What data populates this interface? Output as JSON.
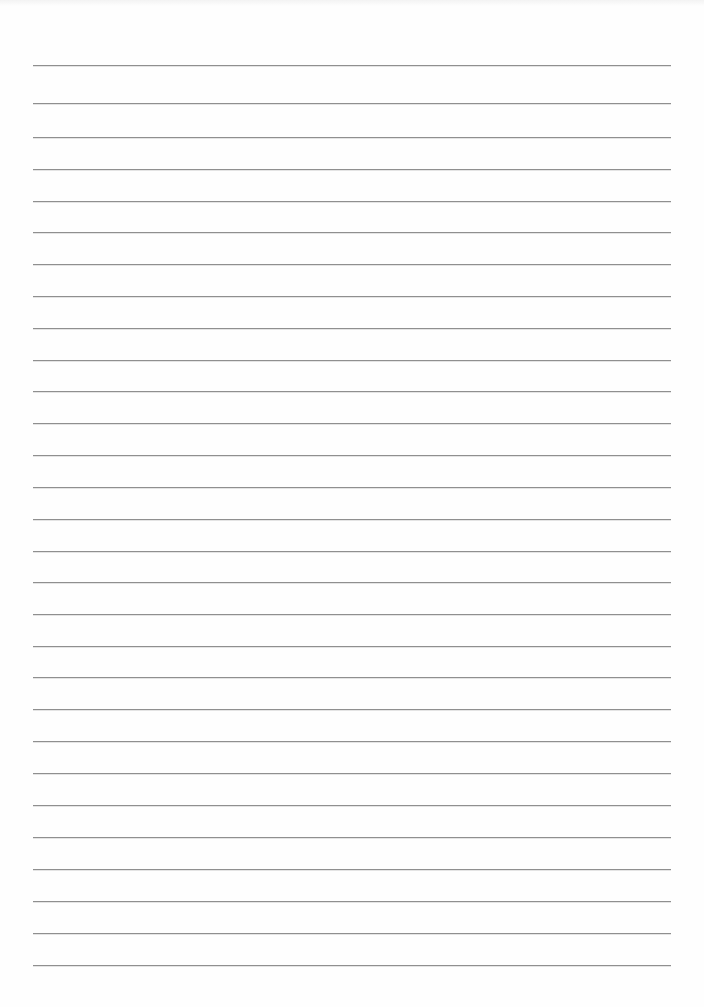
{
  "document": {
    "type": "blank ruled sheet",
    "background_color": "#fefefe",
    "rule_color": "#8f8f8f",
    "rule_left_px": 33,
    "rule_right_px": 671,
    "rules_y_px": [
      65,
      103,
      137,
      169,
      201,
      232,
      264,
      296,
      328,
      360,
      391,
      423,
      455,
      487,
      519,
      551,
      582,
      614,
      646,
      677,
      709,
      741,
      773,
      805,
      837,
      869,
      901,
      933,
      965
    ],
    "rule_count": 29,
    "text_content": ""
  }
}
